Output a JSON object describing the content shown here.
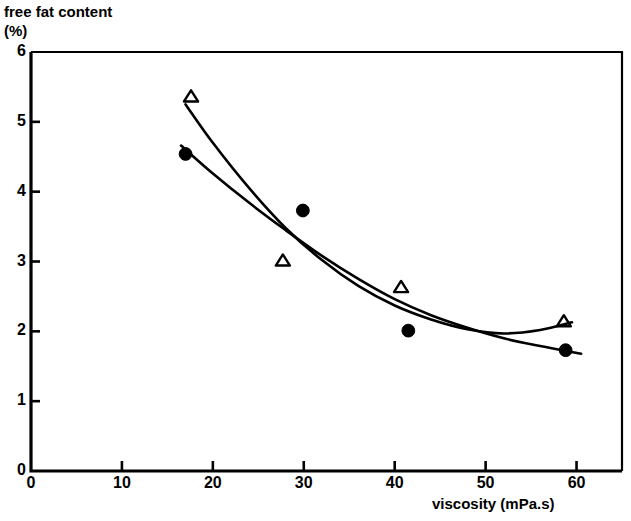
{
  "chart_data": {
    "type": "scatter",
    "title": "",
    "subtitle": "",
    "ylabel_line1": "free fat content",
    "ylabel_line2": "(%)",
    "xlabel": "viscosity (mPa.s)",
    "xlim": [
      0,
      65
    ],
    "ylim": [
      0,
      6
    ],
    "xticks": [
      0,
      10,
      20,
      30,
      40,
      50,
      60
    ],
    "yticks": [
      0,
      1,
      2,
      3,
      4,
      5,
      6
    ],
    "xtick_labels": [
      "0",
      "10",
      "20",
      "30",
      "40",
      "50",
      "60"
    ],
    "ytick_labels": [
      "0",
      "1",
      "2",
      "3",
      "4",
      "5",
      "6"
    ],
    "grid": false,
    "legend": "none",
    "series": [
      {
        "name": "open-triangle-series",
        "marker": "triangle-open",
        "color": "#000000",
        "points": [
          {
            "x": 17.6,
            "y": 5.36
          },
          {
            "x": 27.7,
            "y": 3.01
          },
          {
            "x": 40.7,
            "y": 2.63
          },
          {
            "x": 58.6,
            "y": 2.14
          }
        ],
        "fit_curve": [
          {
            "x": 17.0,
            "y": 5.25
          },
          {
            "x": 20.0,
            "y": 4.7
          },
          {
            "x": 24.0,
            "y": 4.05
          },
          {
            "x": 28.0,
            "y": 3.48
          },
          {
            "x": 32.0,
            "y": 3.02
          },
          {
            "x": 36.0,
            "y": 2.65
          },
          {
            "x": 40.0,
            "y": 2.37
          },
          {
            "x": 44.0,
            "y": 2.17
          },
          {
            "x": 48.0,
            "y": 2.03
          },
          {
            "x": 52.0,
            "y": 1.97
          },
          {
            "x": 56.0,
            "y": 2.02
          },
          {
            "x": 59.5,
            "y": 2.13
          }
        ]
      },
      {
        "name": "filled-circle-series",
        "marker": "circle-filled",
        "color": "#000000",
        "points": [
          {
            "x": 17.0,
            "y": 4.54
          },
          {
            "x": 29.9,
            "y": 3.73
          },
          {
            "x": 41.5,
            "y": 2.01
          },
          {
            "x": 58.8,
            "y": 1.73
          }
        ],
        "fit_curve": [
          {
            "x": 16.5,
            "y": 4.66
          },
          {
            "x": 20.0,
            "y": 4.26
          },
          {
            "x": 24.0,
            "y": 3.84
          },
          {
            "x": 28.0,
            "y": 3.45
          },
          {
            "x": 32.0,
            "y": 3.08
          },
          {
            "x": 36.0,
            "y": 2.75
          },
          {
            "x": 40.0,
            "y": 2.46
          },
          {
            "x": 44.0,
            "y": 2.23
          },
          {
            "x": 48.0,
            "y": 2.05
          },
          {
            "x": 52.0,
            "y": 1.9
          },
          {
            "x": 56.0,
            "y": 1.79
          },
          {
            "x": 60.5,
            "y": 1.68
          }
        ]
      }
    ]
  }
}
